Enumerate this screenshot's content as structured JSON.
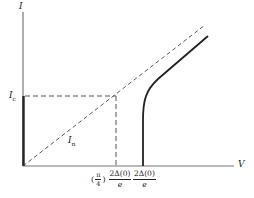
{
  "diagram": {
    "type": "current-voltage characteristic",
    "axes": {
      "y_label": "I",
      "x_label": "V"
    },
    "labels": {
      "critical_current": "I",
      "critical_current_sub": "c",
      "normal_line": "I",
      "normal_line_sub": "n",
      "tick1_prefix_open": "(",
      "tick1_pi": "π",
      "tick1_four": "4",
      "tick1_prefix_close": ")",
      "tick1_num": "2Δ(0)",
      "tick1_den": "e",
      "tick2_num": "2Δ(0)",
      "tick2_den": "e"
    },
    "colors": {
      "line": "#222222",
      "axis": "#555555"
    }
  }
}
